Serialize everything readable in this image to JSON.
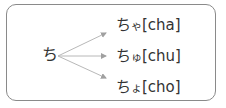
{
  "diagram": {
    "source": "ち",
    "targets": [
      {
        "kana": "ち",
        "small": "ゃ",
        "romaji": "[cha]"
      },
      {
        "kana": "ち",
        "small": "ゅ",
        "romaji": "[chu]"
      },
      {
        "kana": "ち",
        "small": "ょ",
        "romaji": "[cho]"
      }
    ],
    "colors": {
      "border": "#8a8a8a",
      "arrow": "#b0b0b0",
      "text": "#333333"
    }
  }
}
